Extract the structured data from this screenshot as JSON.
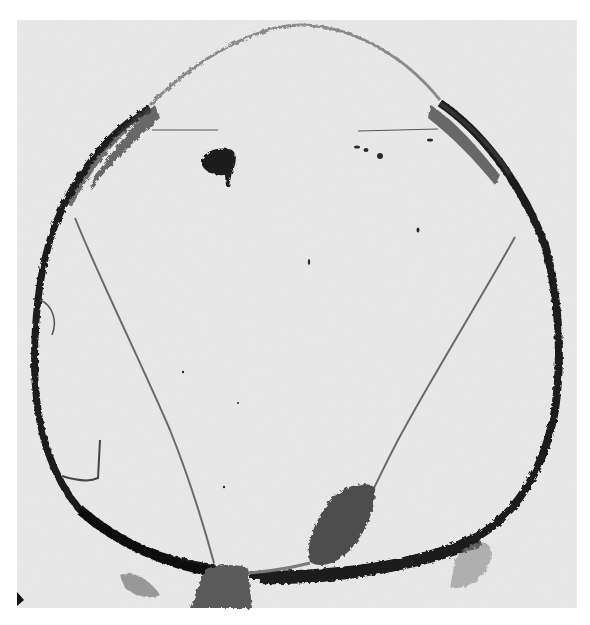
{
  "figure": {
    "kind": "photomicrograph",
    "colors": {
      "page": "#ffffff",
      "plate": "#e8e8e8",
      "tissue_dark": "#1a1a1a",
      "tissue_mid": "#555555",
      "strand": "#6a6a6a"
    },
    "plate_bounds": {
      "x": 17,
      "y": 20,
      "width": 560,
      "height": 588
    }
  }
}
